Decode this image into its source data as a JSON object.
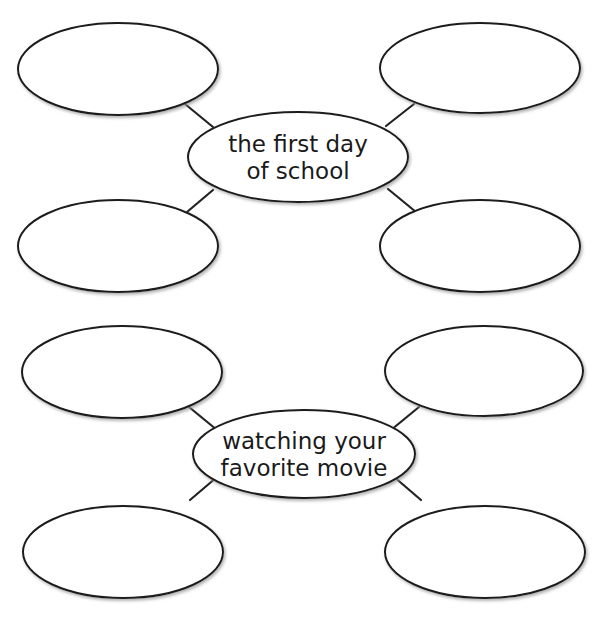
{
  "diagram": {
    "type": "bubble-map",
    "colors": {
      "stroke": "#1a1a1a",
      "fill": "#ffffff",
      "text": "#1a1a1a",
      "shadow": "#9a9a9a"
    },
    "maps": [
      {
        "id": "map-1",
        "center": {
          "lines": [
            "the first day",
            "of school"
          ],
          "cx": 298,
          "cy": 157,
          "rx": 110,
          "ry": 45
        },
        "bubbles": [
          {
            "position": "top-left",
            "cx": 118,
            "cy": 69,
            "rx": 100,
            "ry": 46,
            "text": ""
          },
          {
            "position": "top-right",
            "cx": 480,
            "cy": 68,
            "rx": 100,
            "ry": 45,
            "text": ""
          },
          {
            "position": "bottom-left",
            "cx": 118,
            "cy": 246,
            "rx": 100,
            "ry": 46,
            "text": ""
          },
          {
            "position": "bottom-right",
            "cx": 480,
            "cy": 246,
            "rx": 100,
            "ry": 46,
            "text": ""
          }
        ],
        "connectors": [
          {
            "x1": 185,
            "y1": 104,
            "x2": 213,
            "y2": 127
          },
          {
            "x1": 414,
            "y1": 104,
            "x2": 386,
            "y2": 126
          },
          {
            "x1": 213,
            "y1": 190,
            "x2": 187,
            "y2": 212
          },
          {
            "x1": 388,
            "y1": 189,
            "x2": 416,
            "y2": 212
          }
        ]
      },
      {
        "id": "map-2",
        "center": {
          "lines": [
            "watching your",
            "favorite movie"
          ],
          "cx": 304,
          "cy": 454,
          "rx": 111,
          "ry": 44
        },
        "bubbles": [
          {
            "position": "top-left",
            "cx": 122,
            "cy": 372,
            "rx": 100,
            "ry": 46,
            "text": ""
          },
          {
            "position": "top-right",
            "cx": 484,
            "cy": 371,
            "rx": 99,
            "ry": 45,
            "text": ""
          },
          {
            "position": "bottom-left",
            "cx": 123,
            "cy": 552,
            "rx": 100,
            "ry": 46,
            "text": ""
          },
          {
            "position": "bottom-right",
            "cx": 485,
            "cy": 552,
            "rx": 100,
            "ry": 46,
            "text": ""
          }
        ],
        "connectors": [
          {
            "x1": 189,
            "y1": 407,
            "x2": 217,
            "y2": 430
          },
          {
            "x1": 419,
            "y1": 407,
            "x2": 391,
            "y2": 430
          },
          {
            "x1": 217,
            "y1": 477,
            "x2": 190,
            "y2": 500
          },
          {
            "x1": 393,
            "y1": 476,
            "x2": 421,
            "y2": 500
          }
        ]
      }
    ]
  }
}
